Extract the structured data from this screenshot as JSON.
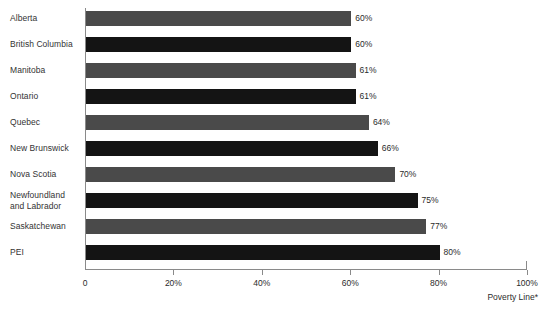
{
  "chart_data": {
    "type": "bar",
    "orientation": "horizontal",
    "title": "",
    "subtitle": "",
    "xlabel": "Poverty Line*",
    "ylabel": "",
    "categories": [
      "Alberta",
      "British Columbia",
      "Manitoba",
      "Ontario",
      "Quebec",
      "New Brunswick",
      "Nova Scotia",
      "Newfoundland\nand Labrador",
      "Saskatchewan",
      "PEI"
    ],
    "values": [
      60,
      60,
      61,
      61,
      64,
      66,
      70,
      75,
      77,
      80
    ],
    "value_labels": [
      "60%",
      "60%",
      "61%",
      "61%",
      "64%",
      "66%",
      "70%",
      "75%",
      "77%",
      "80%"
    ],
    "bar_colors": [
      "#4a4a4a",
      "#141414",
      "#4a4a4a",
      "#141414",
      "#4a4a4a",
      "#141414",
      "#4a4a4a",
      "#141414",
      "#4a4a4a",
      "#141414"
    ],
    "xlim": [
      0,
      100
    ],
    "xticks": [
      0,
      20,
      40,
      60,
      80,
      100
    ],
    "xtick_labels": [
      "0",
      "20%",
      "40%",
      "60%",
      "80%",
      "100%"
    ],
    "grid": false,
    "legend": false,
    "axis_color": "#8a8a8a",
    "text_color": "#2b2b2b",
    "background": "#ffffff"
  }
}
